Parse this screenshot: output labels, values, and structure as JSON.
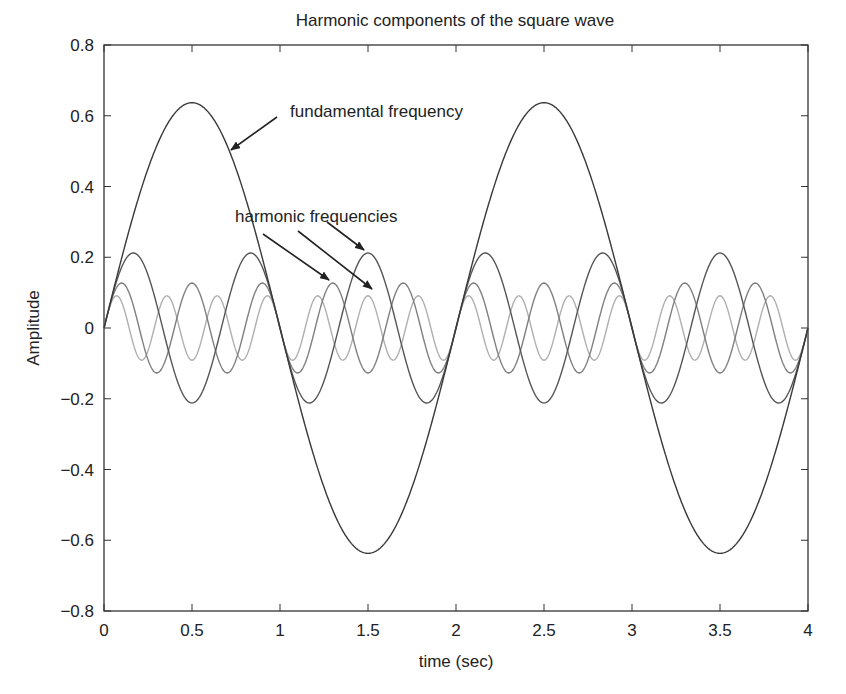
{
  "chart_data": {
    "type": "line",
    "title": "Harmonic components of the square wave",
    "xlabel": "time (sec)",
    "ylabel": "Amplitude",
    "xlim": [
      0,
      4
    ],
    "ylim": [
      -0.8,
      0.8
    ],
    "grid": false,
    "legend": null,
    "x_ticks": [
      "0",
      "0.5",
      "1",
      "1.5",
      "2",
      "2.5",
      "3",
      "3.5",
      "4"
    ],
    "y_ticks": [
      "0.8",
      "0.6",
      "0.4",
      "0.2",
      "0",
      "−0.2",
      "−0.4",
      "−0.6",
      "−0.8"
    ],
    "x": [
      0,
      0.25,
      0.5,
      0.75,
      1,
      1.25,
      1.5,
      1.75,
      2,
      2.25,
      2.5,
      2.75,
      3,
      3.25,
      3.5,
      3.75,
      4
    ],
    "series": [
      {
        "name": "fundamental (1st harmonic)",
        "harmonic": 1,
        "amplitude": 0.637,
        "frequency_hz": 0.5,
        "color": "#3a3a3a",
        "values": [
          0,
          0.45,
          0.637,
          0.45,
          0,
          -0.45,
          -0.637,
          -0.45,
          0,
          0.45,
          0.637,
          0.45,
          0,
          -0.45,
          -0.637,
          -0.45,
          0
        ]
      },
      {
        "name": "3rd harmonic",
        "harmonic": 3,
        "amplitude": 0.212,
        "frequency_hz": 1.5,
        "color": "#555555",
        "values": [
          0,
          0.15,
          -0.212,
          0.15,
          0,
          -0.15,
          0.212,
          -0.15,
          0,
          0.15,
          -0.212,
          0.15,
          0,
          -0.15,
          0.212,
          -0.15,
          0
        ]
      },
      {
        "name": "5th harmonic",
        "harmonic": 5,
        "amplitude": 0.127,
        "frequency_hz": 2.5,
        "color": "#808080",
        "values": [
          0,
          0.09,
          0.127,
          0.09,
          0,
          -0.09,
          -0.127,
          -0.09,
          0,
          0.09,
          0.127,
          0.09,
          0,
          -0.09,
          -0.127,
          -0.09,
          0
        ]
      },
      {
        "name": "7th harmonic",
        "harmonic": 7,
        "amplitude": 0.091,
        "frequency_hz": 3.5,
        "color": "#b0b0b0",
        "values": [
          0,
          -0.064,
          -0.091,
          -0.064,
          0,
          0.064,
          0.091,
          0.064,
          0,
          -0.064,
          -0.091,
          -0.064,
          0,
          0.064,
          0.091,
          0.064,
          0
        ]
      }
    ],
    "annotations": [
      {
        "text": "fundamental frequency",
        "text_pos": [
          290,
          117
        ],
        "arrows": [
          {
            "from": [
              277,
              117
            ],
            "to": [
              231,
              150
            ]
          }
        ]
      },
      {
        "text": "harmonic frequencies",
        "text_pos": [
          235,
          222
        ],
        "arrows": [
          {
            "from": [
              263,
              234
            ],
            "to": [
              329,
              280
            ]
          },
          {
            "from": [
              298,
              231
            ],
            "to": [
              372,
              289
            ]
          },
          {
            "from": [
              327,
              222
            ],
            "to": [
              364,
              250
            ]
          }
        ]
      }
    ]
  },
  "layout": {
    "plot": {
      "left": 104,
      "top": 45,
      "right": 808,
      "bottom": 611
    }
  }
}
